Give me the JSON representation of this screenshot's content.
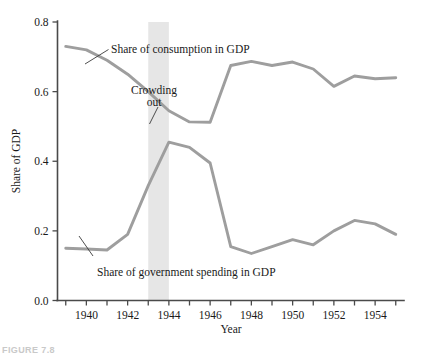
{
  "figure": {
    "caption_partial": "FIGURE 7.8"
  },
  "chart_data": {
    "type": "line",
    "title": "",
    "xlabel": "Year",
    "ylabel": "Share of GDP",
    "xlim": [
      1938.6,
      1955.4
    ],
    "ylim": [
      0.0,
      0.8
    ],
    "grid": false,
    "legend_position": "inline-annotations",
    "x": [
      1939,
      1940,
      1941,
      1942,
      1943,
      1944,
      1945,
      1946,
      1947,
      1948,
      1949,
      1950,
      1951,
      1952,
      1953,
      1954,
      1955
    ],
    "xticks": [
      1939,
      1940,
      1941,
      1942,
      1943,
      1944,
      1945,
      1946,
      1947,
      1948,
      1949,
      1950,
      1951,
      1952,
      1953,
      1954,
      1955
    ],
    "xtick_labels": [
      "",
      "1940",
      "",
      "1942",
      "",
      "1944",
      "",
      "1946",
      "",
      "1948",
      "",
      "1950",
      "",
      "1952",
      "",
      "1954",
      ""
    ],
    "yticks": [
      0.0,
      0.2,
      0.4,
      0.6,
      0.8
    ],
    "ytick_labels": [
      "0.0",
      "0.2",
      "0.4",
      "0.6",
      "0.8"
    ],
    "series": [
      {
        "name": "Share of consumption in GDP",
        "color": "#9e9e9e",
        "values": [
          0.73,
          0.72,
          0.69,
          0.65,
          0.6,
          0.545,
          0.513,
          0.512,
          0.675,
          0.687,
          0.675,
          0.685,
          0.665,
          0.615,
          0.645,
          0.637,
          0.64
        ]
      },
      {
        "name": "Share of government spending in GDP",
        "color": "#9e9e9e",
        "values": [
          0.15,
          0.148,
          0.145,
          0.19,
          0.33,
          0.455,
          0.44,
          0.395,
          0.155,
          0.135,
          0.155,
          0.175,
          0.16,
          0.2,
          0.23,
          0.22,
          0.19
        ]
      }
    ],
    "shaded_band": {
      "label": "Crowding out",
      "x_start": 1943,
      "x_end": 1944,
      "color": "#e6e6e6"
    },
    "annotations": [
      {
        "text": "Share of consumption in GDP",
        "x": 1942.0,
        "y": 0.725
      },
      {
        "text": "Crowding out",
        "line1": "Crowding",
        "line2": "out",
        "x": 1943.2,
        "y": 0.605
      },
      {
        "text": "Share of government spending in GDP",
        "x": 1943.0,
        "y": 0.06
      }
    ]
  }
}
